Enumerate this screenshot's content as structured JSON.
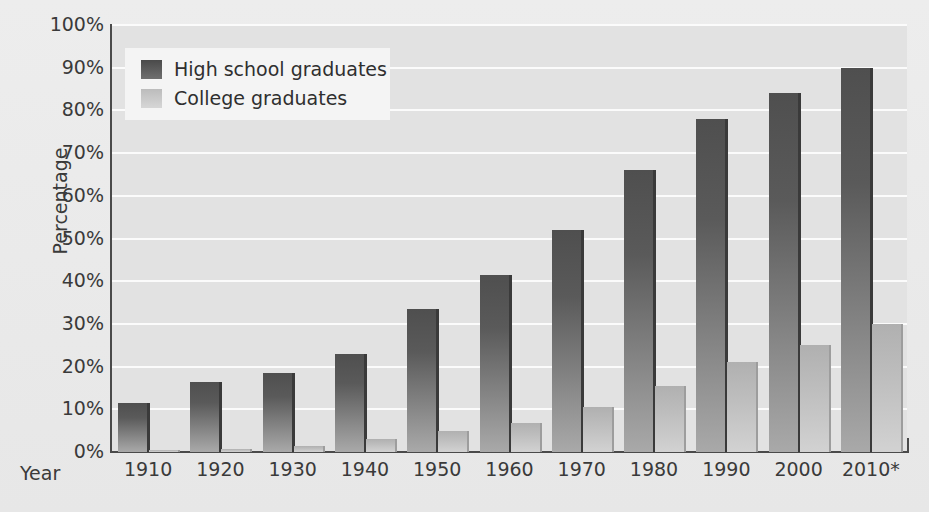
{
  "chart_data": {
    "type": "bar",
    "title": "",
    "xlabel": "Year",
    "ylabel": "Percentage",
    "categories": [
      "1910",
      "1920",
      "1930",
      "1940",
      "1950",
      "1960",
      "1970",
      "1980",
      "1990",
      "2000",
      "2010*"
    ],
    "series": [
      {
        "name": "High school graduates",
        "color": "#5a5a5a",
        "values": [
          11.5,
          16.3,
          18.5,
          23,
          33.5,
          41.5,
          52,
          66,
          78,
          84,
          90
        ]
      },
      {
        "name": "College graduates",
        "color": "#c4c4c4",
        "values": [
          0.5,
          0.8,
          1.5,
          3,
          5,
          6.7,
          10.5,
          15.5,
          21,
          25,
          30
        ]
      }
    ],
    "ylim": [
      0,
      100
    ],
    "yticks": [
      "0%",
      "10%",
      "20%",
      "30%",
      "40%",
      "50%",
      "60%",
      "70%",
      "80%",
      "90%",
      "100%"
    ],
    "ytick_values": [
      0,
      10,
      20,
      30,
      40,
      50,
      60,
      70,
      80,
      90,
      100
    ],
    "grid": true,
    "legend_position": "top-left",
    "legend": [
      "High school graduates",
      "College graduates"
    ],
    "footnote_marker": "*"
  },
  "colors": {
    "figure_background": "#ededed",
    "plot_background": "#e2e2e2",
    "gridline": "#fbfbfb",
    "axis": "#4a4a4a",
    "text": "#3a3a3a",
    "legend_background": "#f4f4f4"
  }
}
